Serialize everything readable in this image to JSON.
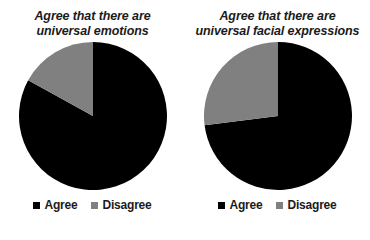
{
  "figure": {
    "background_color": "#ffffff",
    "panels": [
      {
        "title_line1": "Agree that there are",
        "title_line2": "universal emotions",
        "legend": [
          {
            "label": "Agree",
            "color": "#000000",
            "swatch_icon": "square-swatch-black"
          },
          {
            "label": "Disagree",
            "color": "#808080",
            "swatch_icon": "square-swatch-gray"
          }
        ]
      },
      {
        "title_line1": "Agree that there are",
        "title_line2": "universal facial expressions",
        "legend": [
          {
            "label": "Agree",
            "color": "#000000",
            "swatch_icon": "square-swatch-black"
          },
          {
            "label": "Disagree",
            "color": "#808080",
            "swatch_icon": "square-swatch-gray"
          }
        ]
      }
    ]
  },
  "chart_data": [
    {
      "type": "pie",
      "title": "Agree that there are universal emotions",
      "labels": [
        "Agree",
        "Disagree"
      ],
      "values": [
        83,
        17
      ],
      "colors": [
        "#000000",
        "#808080"
      ],
      "start_angle_deg": 0,
      "direction": "clockwise",
      "legend_position": "bottom",
      "grid": false
    },
    {
      "type": "pie",
      "title": "Agree that there are universal facial expressions",
      "labels": [
        "Agree",
        "Disagree"
      ],
      "values": [
        73,
        27
      ],
      "colors": [
        "#000000",
        "#808080"
      ],
      "start_angle_deg": 0,
      "direction": "clockwise",
      "legend_position": "bottom",
      "grid": false
    }
  ]
}
